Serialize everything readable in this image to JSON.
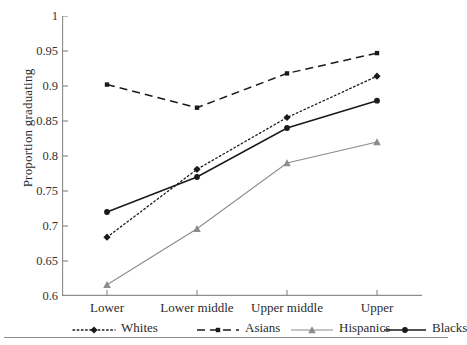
{
  "axes": {
    "ylabel": "Proportion graduating",
    "yticks": [
      "1",
      "0.95",
      "0.9",
      "0.85",
      "0.8",
      "0.75",
      "0.7",
      "0.65",
      "0.6"
    ],
    "ytick_values": [
      1,
      0.95,
      0.9,
      0.85,
      0.8,
      0.75,
      0.7,
      0.65,
      0.6
    ],
    "xticks": [
      "Lower",
      "Lower middle",
      "Upper middle",
      "Upper"
    ]
  },
  "legend": {
    "items": [
      {
        "label": "Whites",
        "marker": "diamond-marker",
        "line": "dotted",
        "color": "#1a1a1a"
      },
      {
        "label": "Asians",
        "marker": "square-marker",
        "line": "dashed",
        "color": "#1a1a1a"
      },
      {
        "label": "Hispanics",
        "marker": "triangle-marker",
        "line": "solid",
        "color": "#8c8c8c"
      },
      {
        "label": "Blacks",
        "marker": "circle-marker",
        "line": "solid",
        "color": "#1a1a1a"
      }
    ]
  },
  "chart_data": {
    "type": "line",
    "title": "",
    "xlabel": "",
    "ylabel": "Proportion graduating",
    "categories": [
      "Lower",
      "Lower middle",
      "Upper middle",
      "Upper"
    ],
    "ylim": [
      0.6,
      1
    ],
    "ytick_step": 0.05,
    "grid": false,
    "legend_position": "bottom",
    "series": [
      {
        "name": "Whites",
        "values": [
          0.684,
          0.781,
          0.855,
          0.914
        ],
        "marker": "diamond",
        "line": "dotted",
        "color": "#1a1a1a"
      },
      {
        "name": "Asians",
        "values": [
          0.902,
          0.869,
          0.918,
          0.947
        ],
        "marker": "square",
        "line": "dashed",
        "color": "#1a1a1a"
      },
      {
        "name": "Hispanics",
        "values": [
          0.616,
          0.696,
          0.79,
          0.82
        ],
        "marker": "triangle",
        "line": "solid",
        "color": "#8c8c8c"
      },
      {
        "name": "Blacks",
        "values": [
          0.72,
          0.77,
          0.84,
          0.879
        ],
        "marker": "circle",
        "line": "solid",
        "color": "#1a1a1a"
      }
    ]
  }
}
